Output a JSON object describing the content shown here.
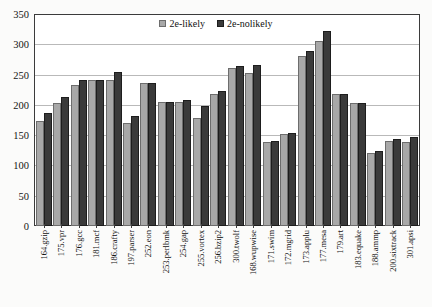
{
  "chart_data": {
    "type": "bar",
    "title": "",
    "xlabel": "",
    "ylabel": "",
    "ylim": [
      0,
      350
    ],
    "yticks": [
      0,
      50,
      100,
      150,
      200,
      250,
      300,
      350
    ],
    "grid": true,
    "legend_position": "top-center",
    "categories": [
      "164.gzip",
      "175.vpr",
      "176.gcc",
      "181.mcf",
      "186.crafty",
      "197.parser",
      "252.eon",
      "253.perlbmk",
      "254.gap",
      "255.vortex",
      "256.bzip2",
      "300.twolf",
      "168.wupwise",
      "171.swim",
      "172.mgrid",
      "173.applu",
      "177.mesa",
      "179.art",
      "183.equake",
      "188.ammp",
      "200.sixtrack",
      "301.apsi"
    ],
    "series": [
      {
        "name": "2e-likely",
        "color": "#a8a8a8",
        "values": [
          170,
          199,
          230,
          238,
          238,
          166,
          232,
          202,
          201,
          175,
          214,
          258,
          250,
          136,
          148,
          278,
          302,
          215,
          199,
          117,
          137,
          136
        ]
      },
      {
        "name": "2e-nolikely",
        "color": "#3a3a3a",
        "values": [
          183,
          209,
          238,
          238,
          251,
          178,
          233,
          202,
          205,
          195,
          219,
          261,
          263,
          137,
          151,
          285,
          318,
          215,
          199,
          121,
          141,
          143
        ]
      }
    ]
  },
  "legend": {
    "entries": [
      {
        "label": "2e-likely"
      },
      {
        "label": "2e-nolikely"
      }
    ]
  }
}
